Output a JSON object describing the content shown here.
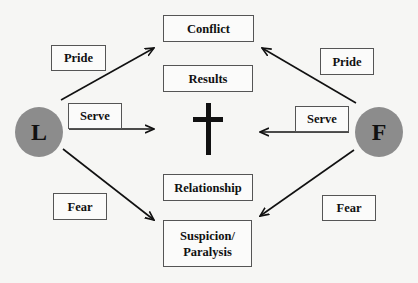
{
  "nodes": {
    "leader": {
      "label": "L"
    },
    "follower": {
      "label": "F"
    },
    "conflict": {
      "label": "Conflict"
    },
    "results": {
      "label": "Results"
    },
    "relationship": {
      "label": "Relationship"
    },
    "suspicion": {
      "label": "Suspicion/ Paralysis",
      "line1": "Suspicion/",
      "line2": "Paralysis"
    },
    "center_symbol": "cross-icon"
  },
  "edge_labels": {
    "pride_left": "Pride",
    "serve_left": "Serve",
    "fear_left": "Fear",
    "pride_right": "Pride",
    "serve_right": "Serve",
    "fear_right": "Fear"
  },
  "edges": [
    {
      "from": "L",
      "to": "Conflict",
      "label": "Pride"
    },
    {
      "from": "L",
      "to": "Cross",
      "label": "Serve"
    },
    {
      "from": "L",
      "to": "Suspicion/Paralysis",
      "label": "Fear"
    },
    {
      "from": "F",
      "to": "Conflict",
      "label": "Pride"
    },
    {
      "from": "F",
      "to": "Cross",
      "label": "Serve"
    },
    {
      "from": "F",
      "to": "Suspicion/Paralysis",
      "label": "Fear"
    }
  ],
  "colors": {
    "circle": "#8c8c8c",
    "line": "#111111",
    "box_border": "#555555",
    "background": "#f6f6f4"
  }
}
